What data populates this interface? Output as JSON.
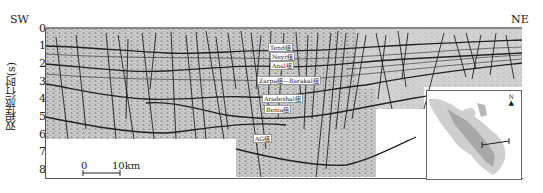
{
  "figure": {
    "direction_left": "SW",
    "direction_right": "NE",
    "y_axis_label": "双程旅行时(s)",
    "y_ticks": [
      "0",
      "1",
      "2",
      "3",
      "4",
      "5",
      "6",
      "7",
      "8"
    ],
    "scale_bar": {
      "start": "0",
      "end": "10km"
    },
    "formation_labels": [
      "Tend组",
      "Neyr组",
      "Anal组",
      "Zarpa组—Barakal组",
      "Aradeshal组",
      "Benia组",
      "AG组"
    ],
    "inset": {
      "north_label": "N"
    }
  }
}
